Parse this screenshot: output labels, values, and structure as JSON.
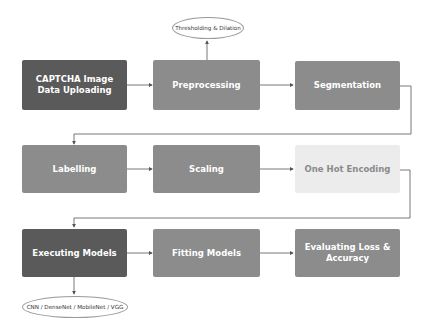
{
  "diagram": {
    "nodes": [
      {
        "id": "captcha-upload",
        "label": "CAPTCHA Image Data Uploading",
        "style": "dark"
      },
      {
        "id": "preprocessing",
        "label": "Preprocessing",
        "style": "mid"
      },
      {
        "id": "segmentation",
        "label": "Segmentation",
        "style": "mid"
      },
      {
        "id": "labelling",
        "label": "Labelling",
        "style": "mid"
      },
      {
        "id": "scaling",
        "label": "Scaling",
        "style": "mid"
      },
      {
        "id": "one-hot",
        "label": "One Hot Encoding",
        "style": "light"
      },
      {
        "id": "executing",
        "label": "Executing Models",
        "style": "dark"
      },
      {
        "id": "fitting",
        "label": "Fitting Models",
        "style": "mid"
      },
      {
        "id": "evaluating",
        "label": "Evaluating Loss & Accuracy",
        "style": "mid"
      }
    ],
    "annotations": [
      {
        "id": "threshold",
        "label": "Thresholding & Dilation",
        "attached_to": "preprocessing"
      },
      {
        "id": "models",
        "label": "CNN / DenseNet / MobileNet / VGG",
        "attached_to": "executing"
      }
    ],
    "colors": {
      "dark": "#5a5a5a",
      "mid": "#8c8c8c",
      "light": "#ececec",
      "line": "#555555"
    }
  }
}
